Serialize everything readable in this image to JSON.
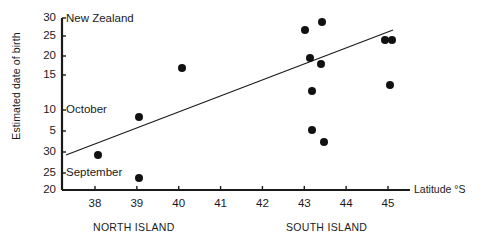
{
  "figure": {
    "region_label": "New Zealand",
    "y_axis_title": "Estimated date of birth",
    "x_axis_title": "Latitude °S"
  },
  "chart_data": {
    "type": "scatter",
    "title": "New Zealand",
    "xlabel": "Latitude °S",
    "ylabel": "Estimated date of birth",
    "xlim": [
      37.3,
      45.8
    ],
    "xticks": [
      38,
      39,
      40,
      41,
      42,
      43,
      44,
      45
    ],
    "xticklabels": [
      "38",
      "39",
      "40",
      "41",
      "42",
      "43",
      "44",
      "45"
    ],
    "grid": false,
    "legend": false,
    "y_axis_note": "Broken/segmented date scale: lower segment is September (20-30), upper segment is October (5-30)",
    "yticks_top_to_bottom": [
      {
        "label": "30",
        "month": "October",
        "y_px": 18
      },
      {
        "label": "25",
        "month": "October",
        "y_px": 36
      },
      {
        "label": "20",
        "month": "October",
        "y_px": 56
      },
      {
        "label": "15",
        "month": "October",
        "y_px": 75
      },
      {
        "label": "10",
        "month": "October",
        "y_px": 110
      },
      {
        "label": "5",
        "month": "October",
        "y_px": 131
      },
      {
        "label": "30",
        "month": "September",
        "y_px": 152
      },
      {
        "label": "25",
        "month": "September",
        "y_px": 173
      },
      {
        "label": "20",
        "month": "September",
        "y_px": 190
      }
    ],
    "month_labels": [
      {
        "text": "October",
        "at_tick": "10"
      },
      {
        "text": "September",
        "at_tick": "25"
      }
    ],
    "group_labels": [
      {
        "text": "NORTH ISLAND",
        "x_range": [
          37.5,
          41.0
        ]
      },
      {
        "text": "SOUTH ISLAND",
        "x_range": [
          42.0,
          45.5
        ]
      }
    ],
    "points": [
      {
        "latitude": 38.0,
        "date": "September 28",
        "x_px": 98,
        "y_px": 155
      },
      {
        "latitude": 39.0,
        "date": "October 8",
        "x_px": 139,
        "y_px": 117
      },
      {
        "latitude": 39.0,
        "date": "September 24",
        "x_px": 139,
        "y_px": 178
      },
      {
        "latitude": 40.0,
        "date": "October 19",
        "x_px": 182,
        "y_px": 68
      },
      {
        "latitude": 43.0,
        "date": "October 27",
        "x_px": 305,
        "y_px": 30
      },
      {
        "latitude": 43.4,
        "date": "October 29",
        "x_px": 322,
        "y_px": 22
      },
      {
        "latitude": 43.1,
        "date": "October 21",
        "x_px": 310,
        "y_px": 58
      },
      {
        "latitude": 43.4,
        "date": "October 20",
        "x_px": 321,
        "y_px": 64
      },
      {
        "latitude": 43.3,
        "date": "October 14",
        "x_px": 312,
        "y_px": 91
      },
      {
        "latitude": 43.3,
        "date": "October 5",
        "x_px": 312,
        "y_px": 130
      },
      {
        "latitude": 44.9,
        "date": "October 25",
        "x_px": 385,
        "y_px": 40
      },
      {
        "latitude": 45.1,
        "date": "October 25",
        "x_px": 392,
        "y_px": 40
      },
      {
        "latitude": 45.0,
        "date": "October 15",
        "x_px": 390,
        "y_px": 85
      },
      {
        "latitude": 43.5,
        "date": "September 29",
        "x_px": 324,
        "y_px": 142
      }
    ],
    "trend_line": {
      "x1_px": 66,
      "y1_px": 155,
      "x2_px": 393,
      "y2_px": 30
    },
    "axes_px": {
      "x_axis_y": 190,
      "x_axis_x1": 62,
      "x_axis_x2": 410,
      "y_axis_x": 62,
      "y_axis_y1": 18,
      "y_axis_y2": 190
    },
    "style": {
      "marker_color": "#111111",
      "marker_size_px": 8,
      "line_color": "#1a1a1a",
      "axis_color": "#1a1a1a",
      "background": "#ffffff"
    }
  }
}
